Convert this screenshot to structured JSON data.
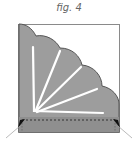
{
  "figure": {
    "caption": "fig. 4",
    "colors": {
      "paper_fill": "#9a9a9a",
      "outline": "#555555",
      "fold_lines": "#ffffff",
      "dashed_line": "#333333",
      "arrow": "#111111",
      "pointer_lines": "#bbbbbb"
    },
    "elements": {
      "square": "paper-square",
      "fan": "scalloped-fan",
      "radial_folds": 5,
      "dashed_fold": "bottom-strip",
      "arrows": [
        "bottom-left",
        "bottom-right"
      ]
    }
  }
}
